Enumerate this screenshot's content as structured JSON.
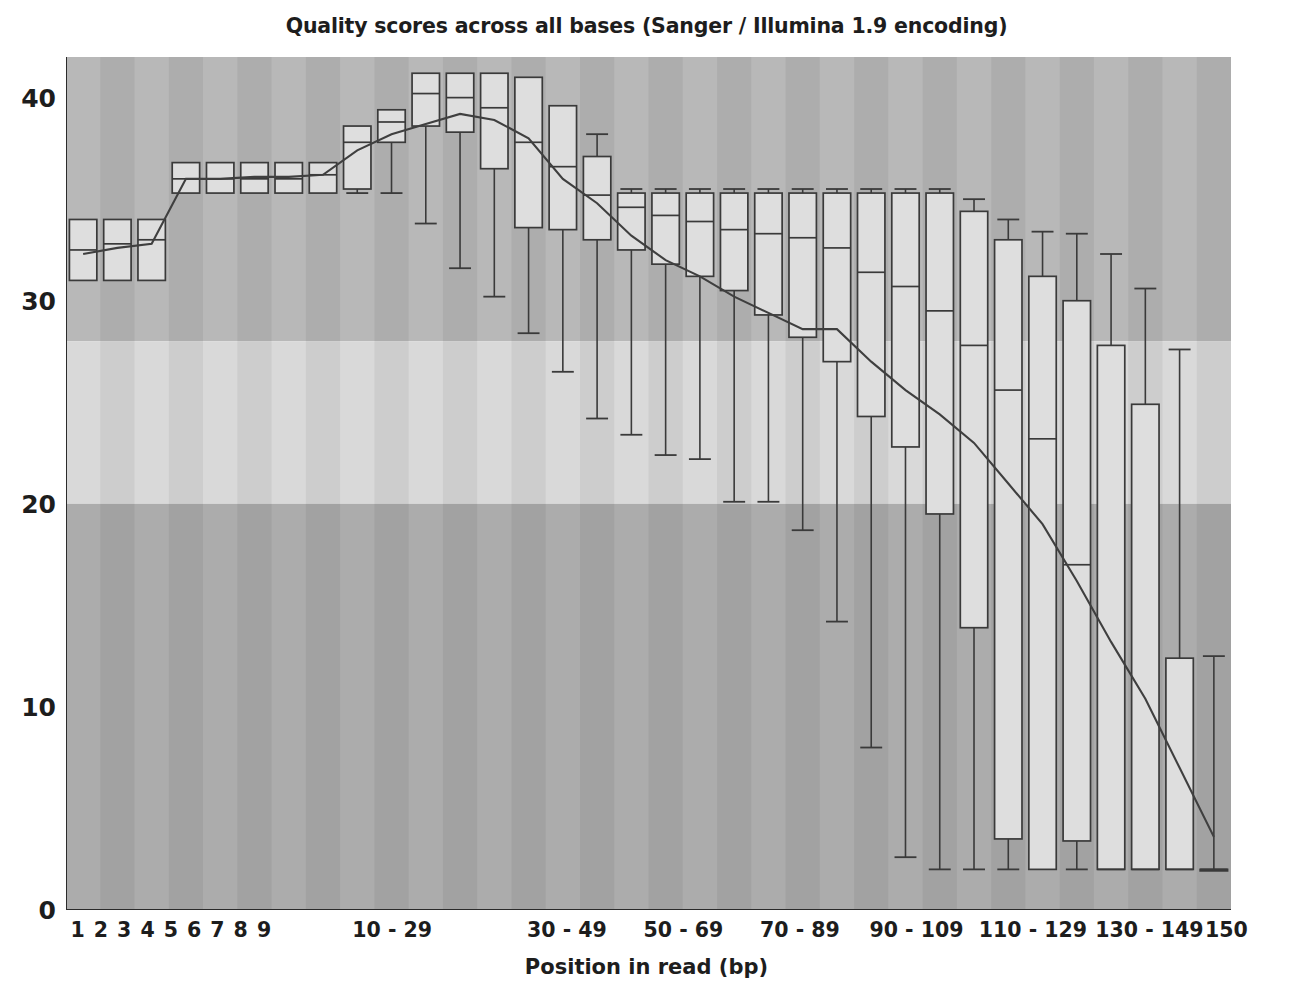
{
  "chart_data": {
    "type": "box",
    "title": "Quality scores across all bases (Sanger / Illumina 1.9 encoding)",
    "xlabel": "Position in read (bp)",
    "ylabel": "",
    "ylim": [
      0,
      42
    ],
    "yticks": [
      0,
      10,
      20,
      30,
      40
    ],
    "ytick_labels": [
      "0",
      "10",
      "20",
      "30",
      "40"
    ],
    "grid": false,
    "legend": "none",
    "background_bands": [
      {
        "name": "good",
        "from": 28,
        "to": 42,
        "color": "#b8b8b8"
      },
      {
        "name": "warn",
        "from": 20,
        "to": 28,
        "color": "#d9d9d9"
      },
      {
        "name": "bad",
        "from": 0,
        "to": 20,
        "color": "#acacac"
      }
    ],
    "stripe_colors": [
      "#bdbdbd",
      "#b0b0b0"
    ],
    "box_fill": "#dedede",
    "box_stroke": "#3a3a3a",
    "mean_line_color": "#3f3f3f",
    "categories": [
      "1",
      "2",
      "3",
      "4",
      "5",
      "6",
      "7",
      "8",
      "9",
      "10-11",
      "12-13",
      "14-15",
      "16-17",
      "18-19",
      "20-21",
      "22-23",
      "24-25",
      "26-27",
      "28-29",
      "30-33",
      "34-37",
      "38-41",
      "42-45",
      "46-49",
      "50-53",
      "54-57",
      "58-61",
      "62-65",
      "66-69",
      "70-73",
      "74-77",
      "78-81",
      "82-85",
      "86-89",
      "90-93",
      "94-97",
      "98-101",
      "102-105",
      "106-109",
      "110-113",
      "114-117",
      "118-121",
      "122-125",
      "126-129",
      "130-133",
      "134-137",
      "138-141",
      "142-145",
      "146-149",
      "150"
    ],
    "xtick_labels": [
      {
        "label": "1",
        "index": 0
      },
      {
        "label": "2",
        "index": 1
      },
      {
        "label": "3",
        "index": 2
      },
      {
        "label": "4",
        "index": 3
      },
      {
        "label": "5",
        "index": 4
      },
      {
        "label": "6",
        "index": 5
      },
      {
        "label": "7",
        "index": 6
      },
      {
        "label": "8",
        "index": 7
      },
      {
        "label": "9",
        "index": 8
      },
      {
        "label": "10 - 29",
        "index": 13.5
      },
      {
        "label": "30 - 49",
        "index": 21.0
      },
      {
        "label": "50 - 69",
        "index": 26.0
      },
      {
        "label": "70 - 89",
        "index": 31.0
      },
      {
        "label": "90 - 109",
        "index": 36.0
      },
      {
        "label": "110 - 129",
        "index": 41.0
      },
      {
        "label": "130 - 149",
        "index": 46.0
      },
      {
        "label": "150",
        "index": 49.3
      }
    ],
    "boxes": [
      {
        "x": "1",
        "lower_whisker": 34.0,
        "q1": 31.0,
        "median": 32.5,
        "q3": 34.0,
        "upper_whisker": 34.0,
        "mean": 32.3
      },
      {
        "x": "2",
        "lower_whisker": 31.0,
        "q1": 31.0,
        "median": 32.8,
        "q3": 34.0,
        "upper_whisker": 34.0,
        "mean": 32.6
      },
      {
        "x": "3",
        "lower_whisker": 31.0,
        "q1": 31.0,
        "median": 33.0,
        "q3": 34.0,
        "upper_whisker": 34.0,
        "mean": 32.8
      },
      {
        "x": "4",
        "lower_whisker": 35.3,
        "q1": 35.3,
        "median": 36.0,
        "q3": 36.8,
        "upper_whisker": 36.8,
        "mean": 36.0
      },
      {
        "x": "5",
        "lower_whisker": 35.3,
        "q1": 35.3,
        "median": 36.0,
        "q3": 36.8,
        "upper_whisker": 36.8,
        "mean": 36.0
      },
      {
        "x": "6",
        "lower_whisker": 35.3,
        "q1": 35.3,
        "median": 36.0,
        "q3": 36.8,
        "upper_whisker": 36.8,
        "mean": 36.1
      },
      {
        "x": "7",
        "lower_whisker": 35.3,
        "q1": 35.3,
        "median": 36.0,
        "q3": 36.8,
        "upper_whisker": 36.8,
        "mean": 36.1
      },
      {
        "x": "8",
        "lower_whisker": 35.3,
        "q1": 35.3,
        "median": 36.2,
        "q3": 36.8,
        "upper_whisker": 36.8,
        "mean": 36.2
      },
      {
        "x": "9",
        "lower_whisker": 35.3,
        "q1": 35.5,
        "median": 37.8,
        "q3": 38.6,
        "upper_whisker": 38.6,
        "mean": 37.4
      },
      {
        "x": "10-11",
        "lower_whisker": 35.3,
        "q1": 37.8,
        "median": 38.8,
        "q3": 39.4,
        "upper_whisker": 39.4,
        "mean": 38.2
      },
      {
        "x": "12-13",
        "lower_whisker": 33.8,
        "q1": 38.6,
        "median": 40.2,
        "q3": 41.2,
        "upper_whisker": 41.2,
        "mean": 38.7
      },
      {
        "x": "14-15",
        "lower_whisker": 31.6,
        "q1": 38.3,
        "median": 40.0,
        "q3": 41.2,
        "upper_whisker": 41.2,
        "mean": 39.2
      },
      {
        "x": "16-17",
        "lower_whisker": 30.2,
        "q1": 36.5,
        "median": 39.5,
        "q3": 41.2,
        "upper_whisker": 41.2,
        "mean": 38.9
      },
      {
        "x": "18-19",
        "lower_whisker": 28.4,
        "q1": 33.6,
        "median": 37.8,
        "q3": 41.0,
        "upper_whisker": 41.0,
        "mean": 38.0
      },
      {
        "x": "20-21",
        "lower_whisker": 26.5,
        "q1": 33.5,
        "median": 36.6,
        "q3": 39.6,
        "upper_whisker": 39.6,
        "mean": 36.0
      },
      {
        "x": "22-23",
        "lower_whisker": 24.2,
        "q1": 33.0,
        "median": 35.2,
        "q3": 37.1,
        "upper_whisker": 38.2,
        "mean": 34.8
      },
      {
        "x": "24-25",
        "lower_whisker": 23.4,
        "q1": 32.5,
        "median": 34.6,
        "q3": 35.3,
        "upper_whisker": 35.5,
        "mean": 33.2
      },
      {
        "x": "26-27",
        "lower_whisker": 22.4,
        "q1": 31.8,
        "median": 34.2,
        "q3": 35.3,
        "upper_whisker": 35.5,
        "mean": 32.0
      },
      {
        "x": "28-29",
        "lower_whisker": 22.2,
        "q1": 31.2,
        "median": 33.9,
        "q3": 35.3,
        "upper_whisker": 35.5,
        "mean": 31.2
      },
      {
        "x": "30-33",
        "lower_whisker": 20.1,
        "q1": 30.5,
        "median": 33.5,
        "q3": 35.3,
        "upper_whisker": 35.5,
        "mean": 30.2
      },
      {
        "x": "34-37",
        "lower_whisker": 20.1,
        "q1": 29.3,
        "median": 33.3,
        "q3": 35.3,
        "upper_whisker": 35.5,
        "mean": 29.4
      },
      {
        "x": "38-41",
        "lower_whisker": 18.7,
        "q1": 28.2,
        "median": 33.1,
        "q3": 35.3,
        "upper_whisker": 35.5,
        "mean": 28.6
      },
      {
        "x": "42-45",
        "lower_whisker": 14.2,
        "q1": 27.0,
        "median": 32.6,
        "q3": 35.3,
        "upper_whisker": 35.5,
        "mean": 28.6
      },
      {
        "x": "46-49",
        "lower_whisker": 8.0,
        "q1": 24.3,
        "median": 31.4,
        "q3": 35.3,
        "upper_whisker": 35.5,
        "mean": 27.0
      },
      {
        "x": "50-53",
        "lower_whisker": 2.6,
        "q1": 22.8,
        "median": 30.7,
        "q3": 35.3,
        "upper_whisker": 35.5,
        "mean": 25.6
      },
      {
        "x": "54-57",
        "lower_whisker": 2.0,
        "q1": 19.5,
        "median": 29.5,
        "q3": 35.3,
        "upper_whisker": 35.5,
        "mean": 24.4
      },
      {
        "x": "58-61",
        "lower_whisker": 2.0,
        "q1": 13.9,
        "median": 27.8,
        "q3": 34.4,
        "upper_whisker": 35.0,
        "mean": 23.0
      },
      {
        "x": "62-65",
        "lower_whisker": 2.0,
        "q1": 3.5,
        "median": 25.6,
        "q3": 33.0,
        "upper_whisker": 34.0,
        "mean": 21.0
      },
      {
        "x": "66-69",
        "lower_whisker": 2.0,
        "q1": 2.0,
        "median": 23.2,
        "q3": 31.2,
        "upper_whisker": 33.4,
        "mean": 19.0
      },
      {
        "x": "70-73",
        "lower_whisker": 2.0,
        "q1": 3.4,
        "median": 17.0,
        "q3": 30.0,
        "upper_whisker": 33.3,
        "mean": 16.2
      },
      {
        "x": "74-77",
        "lower_whisker": 2.0,
        "q1": 2.0,
        "median": 2.0,
        "q3": 27.8,
        "upper_whisker": 32.3,
        "mean": 13.2
      },
      {
        "x": "78-81",
        "lower_whisker": 2.0,
        "q1": 2.0,
        "median": 2.0,
        "q3": 24.9,
        "upper_whisker": 30.6,
        "mean": 10.4
      },
      {
        "x": "82-85",
        "lower_whisker": 2.0,
        "q1": 2.0,
        "median": 2.0,
        "q3": 12.4,
        "upper_whisker": 27.6,
        "mean": 7.0
      },
      {
        "x": "86-89",
        "lower_whisker": 2.0,
        "q1": 2.0,
        "median": 2.0,
        "q3": 2.0,
        "upper_whisker": 12.5,
        "mean": 3.6
      }
    ],
    "mean_series": {
      "name": "Mean quality",
      "values": [
        32.3,
        32.6,
        32.8,
        36.0,
        36.0,
        36.1,
        36.1,
        36.2,
        37.4,
        38.2,
        38.7,
        39.2,
        38.9,
        38.0,
        36.0,
        34.8,
        33.2,
        32.0,
        31.2,
        30.2,
        29.4,
        28.6,
        28.6,
        27.0,
        25.6,
        24.4,
        23.0,
        21.0,
        19.0,
        16.2,
        13.2,
        10.4,
        7.0,
        3.6
      ]
    }
  }
}
